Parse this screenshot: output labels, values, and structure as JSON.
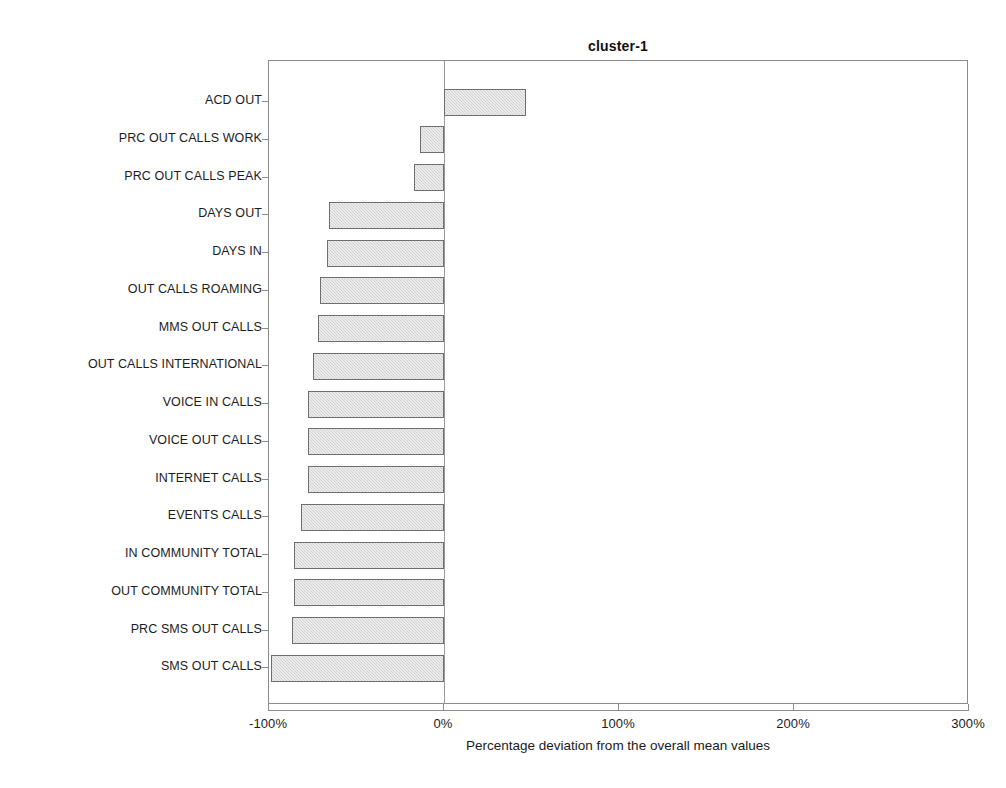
{
  "chart_data": {
    "type": "bar",
    "orientation": "horizontal",
    "title": "cluster-1",
    "xlabel": "Percentage deviation from the overall mean values",
    "ylabel": "",
    "xlim": [
      -100,
      300
    ],
    "xticks": [
      -100,
      0,
      100,
      200,
      300
    ],
    "xtick_labels": [
      "-100%",
      "0%",
      "100%",
      "200%",
      "300%"
    ],
    "grid": false,
    "legend": null,
    "zero_reference_line": 0,
    "bar_fill_color": "#d2d2d2",
    "bar_edge_color": "#6e6e6e",
    "categories": [
      "ACD OUT",
      "PRC OUT CALLS WORK",
      "PRC OUT CALLS PEAK",
      "DAYS OUT",
      "DAYS IN",
      "OUT CALLS ROAMING",
      "MMS OUT CALLS",
      "OUT CALLS INTERNATIONAL",
      "VOICE IN CALLS",
      "VOICE OUT CALLS",
      "INTERNET CALLS",
      "EVENTS CALLS",
      "IN COMMUNITY TOTAL",
      "OUT COMMUNITY TOTAL",
      "PRC SMS OUT CALLS",
      "SMS OUT CALLS"
    ],
    "values": [
      47,
      -14,
      -17,
      -66,
      -67,
      -71,
      -72,
      -75,
      -78,
      -78,
      -78,
      -82,
      -86,
      -86,
      -87,
      -99
    ]
  }
}
